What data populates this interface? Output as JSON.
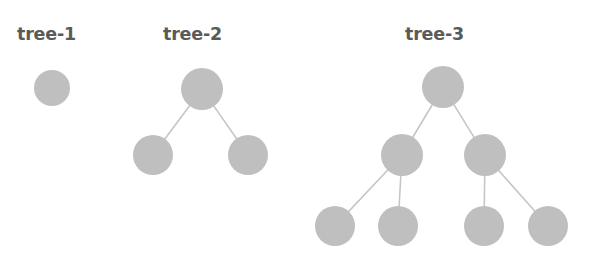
{
  "diagram": {
    "title_text_present": false,
    "background_color": "#ffffff",
    "node_fill_color": "#bfbfbf",
    "edge_color": "#c6c6c6",
    "label_color": "#5a5a5a",
    "label_font_size_px": 17.5,
    "edge_width_px": 1.6,
    "canvas": {
      "width": 608,
      "height": 261
    }
  },
  "trees": [
    {
      "id": "tree-1",
      "label": "tree-1",
      "label_x": 17,
      "label_y": 40,
      "node_count": 1,
      "depth": 1,
      "nodes": [
        {
          "id": "t1-root",
          "name": "root",
          "cx": 52,
          "cy": 88,
          "r": 18,
          "level": 0
        }
      ],
      "edges": []
    },
    {
      "id": "tree-2",
      "label": "tree-2",
      "label_x": 163,
      "label_y": 40,
      "node_count": 3,
      "depth": 2,
      "nodes": [
        {
          "id": "t2-root",
          "name": "root",
          "cx": 202,
          "cy": 89,
          "r": 21,
          "level": 0
        },
        {
          "id": "t2-left",
          "name": "left-child",
          "cx": 153,
          "cy": 155,
          "r": 20,
          "level": 1
        },
        {
          "id": "t2-right",
          "name": "right-child",
          "cx": 248,
          "cy": 155,
          "r": 20,
          "level": 1
        }
      ],
      "edges": [
        {
          "from": "t2-root",
          "to": "t2-left"
        },
        {
          "from": "t2-root",
          "to": "t2-right"
        }
      ]
    },
    {
      "id": "tree-3",
      "label": "tree-3",
      "label_x": 405,
      "label_y": 40,
      "node_count": 7,
      "depth": 3,
      "nodes": [
        {
          "id": "t3-root",
          "name": "root",
          "cx": 443,
          "cy": 87,
          "r": 21,
          "level": 0
        },
        {
          "id": "t3-l",
          "name": "left-child",
          "cx": 402,
          "cy": 155,
          "r": 21,
          "level": 1
        },
        {
          "id": "t3-r",
          "name": "right-child",
          "cx": 485,
          "cy": 155,
          "r": 21,
          "level": 1
        },
        {
          "id": "t3-ll",
          "name": "left-left-leaf",
          "cx": 335,
          "cy": 226,
          "r": 20,
          "level": 2
        },
        {
          "id": "t3-lr",
          "name": "left-right-leaf",
          "cx": 398,
          "cy": 226,
          "r": 20,
          "level": 2
        },
        {
          "id": "t3-rl",
          "name": "right-left-leaf",
          "cx": 484,
          "cy": 226,
          "r": 20,
          "level": 2
        },
        {
          "id": "t3-rr",
          "name": "right-right-leaf",
          "cx": 548,
          "cy": 226,
          "r": 20,
          "level": 2
        }
      ],
      "edges": [
        {
          "from": "t3-root",
          "to": "t3-l"
        },
        {
          "from": "t3-root",
          "to": "t3-r"
        },
        {
          "from": "t3-l",
          "to": "t3-ll"
        },
        {
          "from": "t3-l",
          "to": "t3-lr"
        },
        {
          "from": "t3-r",
          "to": "t3-rl"
        },
        {
          "from": "t3-r",
          "to": "t3-rr"
        }
      ]
    }
  ]
}
